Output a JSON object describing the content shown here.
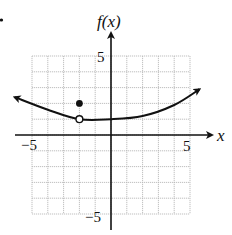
{
  "chart_data": {
    "type": "line",
    "title": "",
    "xlabel": "x",
    "ylabel": "f(x)",
    "xlim": [
      -5,
      5
    ],
    "ylim": [
      -5,
      5
    ],
    "grid": true,
    "grid_step": 1,
    "tick_labels": {
      "x": [
        {
          "value": -5,
          "label": "−5"
        },
        {
          "value": 5,
          "label": "5"
        }
      ],
      "y": [
        {
          "value": 5,
          "label": "5"
        },
        {
          "value": -5,
          "label": "−5"
        }
      ]
    },
    "series": [
      {
        "name": "f(x)",
        "style": "smooth curve with arrows on both ends",
        "points": [
          [
            -6.1,
            2.4
          ],
          [
            -4,
            1.6
          ],
          [
            -2,
            1.0
          ],
          [
            0,
            1.0
          ],
          [
            2,
            1.2
          ],
          [
            4,
            1.9
          ],
          [
            5.6,
            2.9
          ]
        ]
      }
    ],
    "annotations": [
      {
        "type": "open-circle",
        "x": -2,
        "y": 1,
        "meaning": "hole in curve"
      },
      {
        "type": "filled-dot",
        "x": -2,
        "y": 2,
        "meaning": "defined point f(-2)=2"
      }
    ]
  },
  "labels": {
    "y_axis": "f(x)",
    "x_axis": "x",
    "x_min": "−5",
    "x_max": "5",
    "y_max": "5",
    "y_min": "−5"
  },
  "colors": {
    "curve": "#111111",
    "grid": "#b8b8b8",
    "axis": "#111111"
  }
}
